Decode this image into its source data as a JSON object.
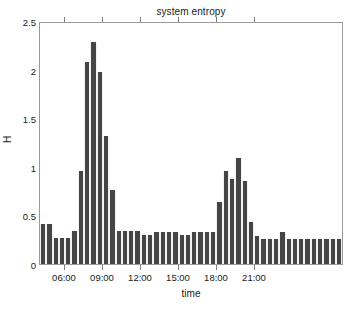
{
  "chart_data": {
    "type": "bar",
    "title": "system entropy",
    "xlabel": "time",
    "ylabel": "H",
    "ylim": [
      0,
      2.5
    ],
    "yticks": [
      0,
      0.5,
      1,
      1.5,
      2,
      2.5
    ],
    "ytick_labels": [
      "0",
      "0.5",
      "1",
      "1.5",
      "2",
      "2.5"
    ],
    "xtick_labels": [
      "06:00",
      "09:00",
      "12:00",
      "15:00",
      "18:00",
      "21:00"
    ],
    "xtick_values": [
      "06:00",
      "09:00",
      "12:00",
      "15:00",
      "18:00",
      "21:00"
    ],
    "grid": false,
    "legend": null,
    "bar_color": "#454545",
    "axis_color": "#9a9a9a",
    "background_color": "#ffffff",
    "bin_minutes": 30,
    "categories": [
      "04:00",
      "04:30",
      "05:00",
      "05:30",
      "06:00",
      "06:30",
      "07:00",
      "07:30",
      "08:00",
      "08:30",
      "09:00",
      "09:30",
      "10:00",
      "10:30",
      "11:00",
      "11:30",
      "12:00",
      "12:30",
      "13:00",
      "13:30",
      "14:00",
      "14:30",
      "15:00",
      "15:30",
      "16:00",
      "16:30",
      "17:00",
      "17:30",
      "18:00",
      "18:30",
      "19:00",
      "19:30",
      "20:00",
      "20:30",
      "21:00",
      "21:30",
      "22:00",
      "22:30",
      "23:00",
      "23:30",
      "00:00",
      "00:30",
      "01:00",
      "01:30",
      "02:00",
      "02:30",
      "03:00",
      "03:30"
    ],
    "values": [
      0.41,
      0.41,
      0.27,
      0.27,
      0.27,
      0.34,
      0.97,
      2.1,
      2.3,
      1.99,
      1.33,
      0.77,
      0.34,
      0.34,
      0.34,
      0.34,
      0.3,
      0.3,
      0.33,
      0.33,
      0.33,
      0.33,
      0.3,
      0.3,
      0.33,
      0.33,
      0.33,
      0.33,
      0.64,
      0.97,
      0.88,
      1.1,
      0.86,
      0.44,
      0.29,
      0.26,
      0.26,
      0.26,
      0.33,
      0.26,
      0.26,
      0.26,
      0.26,
      0.26,
      0.26,
      0.26,
      0.26,
      0.26
    ]
  }
}
